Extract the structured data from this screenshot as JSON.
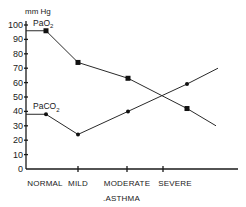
{
  "chart_data": {
    "type": "line",
    "title": "",
    "ylabel": "mm Hg",
    "xlabel": ".ASTHMA",
    "ylim": [
      0,
      100
    ],
    "yticks": [
      0,
      10,
      20,
      30,
      40,
      50,
      60,
      70,
      80,
      90,
      100
    ],
    "ytick_labels": [
      "0",
      "10",
      "20",
      "30",
      "40",
      "50",
      "60",
      "70",
      "80",
      "90",
      "100"
    ],
    "categories": [
      "NORMAL",
      "MILD",
      "MODERATE",
      "SEVERE"
    ],
    "grid": false,
    "legend": "inline labels",
    "series": [
      {
        "name": "PaO2",
        "label_main": "PaO",
        "label_sub": "2",
        "marker": "square",
        "values": [
          96,
          74,
          63,
          42
        ],
        "baseline_start": 96,
        "trend_end": 30
      },
      {
        "name": "PaCO2",
        "label_main": "PaCO",
        "label_sub": "2",
        "marker": "circle",
        "values": [
          38,
          24,
          40,
          59
        ],
        "baseline_start": 38,
        "trend_end": 70
      }
    ]
  }
}
